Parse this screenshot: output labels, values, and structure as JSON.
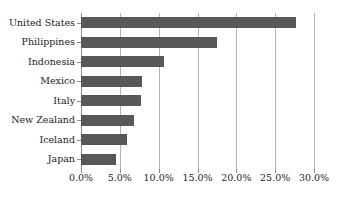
{
  "chart_data": {
    "type": "bar",
    "orientation": "horizontal",
    "title": "",
    "subtitle": "",
    "xlabel": "",
    "ylabel": "",
    "categories": [
      "United States",
      "Philippines",
      "Indonesia",
      "Mexico",
      "Italy",
      "New Zealand",
      "Iceland",
      "Japan"
    ],
    "values": [
      27.7,
      17.5,
      10.7,
      7.9,
      7.7,
      6.8,
      5.9,
      4.5
    ],
    "value_labels": [
      "27.7%",
      "17.5%",
      "10.7%",
      "7.9%",
      "7.7%",
      "6.8%",
      "5.9%",
      "4.5%"
    ],
    "xlim": [
      0,
      30
    ],
    "ylim": null,
    "xticks": [
      0,
      5,
      10,
      15,
      20,
      25,
      30
    ],
    "xtick_labels": [
      "0.0%",
      "5.0%",
      "10.0%",
      "15.0%",
      "20.0%",
      "25.0%",
      "30.0%"
    ],
    "grid": "vertical",
    "legend": null,
    "legend_position": "none",
    "annotations": [],
    "series": [
      {
        "name": "",
        "values": [
          27.7,
          17.5,
          10.7,
          7.9,
          7.7,
          6.8,
          5.9,
          4.5
        ],
        "color": "#585858"
      }
    ]
  },
  "style": {
    "bar_color": "#585858",
    "gridline_color": "#b4b4b4",
    "axis_color": "#8c8c8c",
    "text_color": "#1c1c1c",
    "background": "#ffffff"
  }
}
